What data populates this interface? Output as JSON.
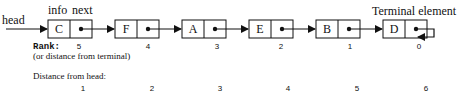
{
  "labels": {
    "head": "head",
    "info": "info",
    "next": "next",
    "terminal": "Terminal element",
    "rank": "Rank:",
    "rank_sub": "(or distance from terminal)",
    "distance_header": "Distance from head:"
  },
  "nodes": [
    {
      "info": "C",
      "rank": "5",
      "distance": "1"
    },
    {
      "info": "F",
      "rank": "4",
      "distance": "2"
    },
    {
      "info": "A",
      "rank": "3",
      "distance": "3"
    },
    {
      "info": "E",
      "rank": "2",
      "distance": "4"
    },
    {
      "info": "B",
      "rank": "1",
      "distance": "5"
    },
    {
      "info": "D",
      "rank": "0",
      "distance": "6"
    }
  ]
}
